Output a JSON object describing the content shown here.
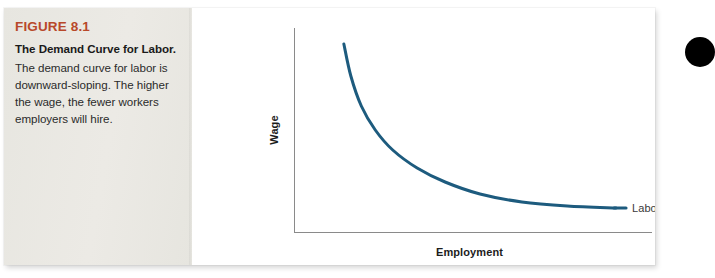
{
  "figure": {
    "number": "FIGURE 8.1",
    "title": "The Demand Curve for Labor.",
    "description": "The demand curve for labor is downward-sloping. The higher the wage, the fewer workers employers will hire."
  },
  "colors": {
    "figure_number": "#b8482a",
    "caption_panel": "#e9e8e3",
    "curve": "#1d5b7e",
    "axis": "#808080",
    "label_text": "#1c1c1c",
    "series_label_text": "#3a3a3a",
    "bullet_dot": "#000000"
  },
  "chart_data": {
    "type": "line",
    "title": "",
    "xlabel": "Employment",
    "ylabel": "Wage",
    "xlim": [
      0,
      100
    ],
    "ylim": [
      0,
      100
    ],
    "grid": false,
    "axis_ticks": false,
    "legend": "inline-end-label",
    "series": [
      {
        "name": "Labor demand",
        "color": "#1d5b7e",
        "points": [
          [
            14,
            94
          ],
          [
            16,
            78
          ],
          [
            19,
            63
          ],
          [
            23,
            51
          ],
          [
            28,
            41
          ],
          [
            35,
            32
          ],
          [
            43,
            25
          ],
          [
            53,
            19
          ],
          [
            65,
            15
          ],
          [
            78,
            13
          ],
          [
            92,
            12
          ]
        ]
      }
    ],
    "annotations": [
      {
        "text": "Labor demand",
        "x": 96,
        "y": 12,
        "anchor": "start"
      }
    ]
  },
  "decorations": {
    "bullet_dot_name": "page-bullet-dot"
  }
}
